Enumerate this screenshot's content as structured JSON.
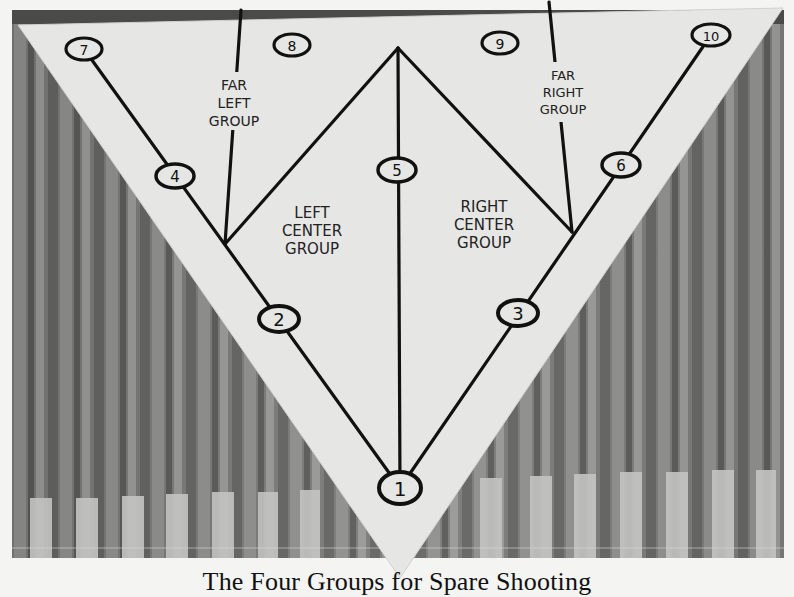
{
  "figure": {
    "caption": "The Four Groups for Spare Shooting",
    "colors": {
      "paper": "#e8e8e6",
      "ink": "#111111",
      "lane_dark": "#6e6e6c",
      "lane_light": "#b8b8b6",
      "page": "#f4f4f2"
    }
  },
  "pins": [
    {
      "number": "1",
      "x": 400,
      "y": 488
    },
    {
      "number": "2",
      "x": 279,
      "y": 319
    },
    {
      "number": "3",
      "x": 518,
      "y": 313
    },
    {
      "number": "4",
      "x": 175,
      "y": 176
    },
    {
      "number": "5",
      "x": 397,
      "y": 170
    },
    {
      "number": "6",
      "x": 621,
      "y": 165
    },
    {
      "number": "7",
      "x": 84,
      "y": 49
    },
    {
      "number": "8",
      "x": 292,
      "y": 45
    },
    {
      "number": "9",
      "x": 500,
      "y": 43
    },
    {
      "number": "10",
      "x": 711,
      "y": 35
    }
  ],
  "groups": {
    "far_left": {
      "line1": "FAR",
      "line2": "LEFT",
      "line3": "GROUP"
    },
    "left_center": {
      "line1": "LEFT",
      "line2": "CENTER",
      "line3": "GROUP"
    },
    "right_center": {
      "line1": "RIGHT",
      "line2": "CENTER",
      "line3": "GROUP"
    },
    "far_right": {
      "line1": "FAR",
      "line2": "RIGHT",
      "line3": "GROUP"
    }
  }
}
